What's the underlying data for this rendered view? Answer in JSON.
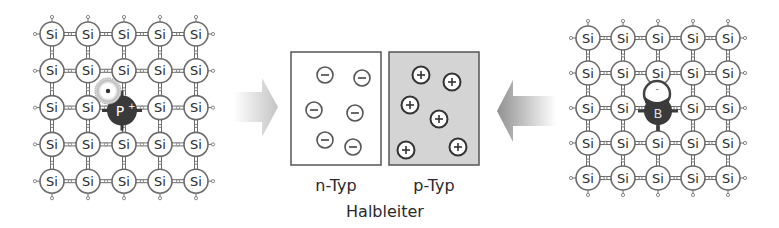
{
  "diagram": {
    "left_lattice": {
      "atom_label": "Si",
      "rows": 5,
      "cols": 5,
      "dopant": {
        "label": "P",
        "superscript": "+",
        "row": 2,
        "col": 2
      },
      "free_carrier": "electron"
    },
    "right_lattice": {
      "atom_label": "Si",
      "rows": 5,
      "cols": 5,
      "dopant": {
        "label": "B",
        "superscript": "-",
        "row": 2,
        "col": 2
      },
      "free_carrier": "hole"
    },
    "arrows": [
      {
        "name": "left-arrow",
        "direction": "right"
      },
      {
        "name": "right-arrow",
        "direction": "left"
      }
    ],
    "n_box": {
      "label": "n-Typ",
      "charge_symbol": "−",
      "count": 6,
      "fill": "#ffffff"
    },
    "p_box": {
      "label": "p-Typ",
      "charge_symbol": "+",
      "count": 6,
      "fill": "#d4d4d4"
    },
    "caption": "Halbleiter"
  },
  "colors": {
    "line": "#6b6b6b",
    "text": "#2a2a2a",
    "dopant_fill": "#3a3a3a",
    "arrow_light": "#c8c8c8",
    "arrow_dark": "#9a9a9a",
    "p_fill": "#d4d4d4"
  }
}
